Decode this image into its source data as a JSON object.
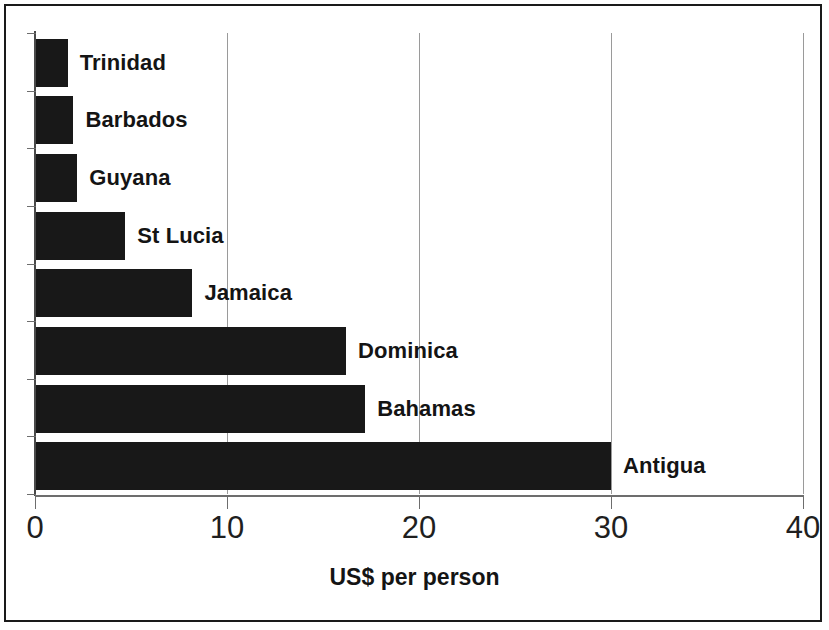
{
  "chart_data": {
    "type": "bar",
    "orientation": "horizontal",
    "title": "",
    "xlabel": "US$ per person",
    "ylabel": "",
    "categories": [
      "Trinidad",
      "Barbados",
      "Guyana",
      "St Lucia",
      "Jamaica",
      "Dominica",
      "Bahamas",
      "Antigua"
    ],
    "values": [
      1.7,
      2.0,
      2.2,
      4.7,
      8.2,
      16.2,
      17.2,
      30.0
    ],
    "xlim": [
      0,
      40
    ],
    "xticks": [
      0,
      10,
      20,
      30,
      40
    ],
    "xtick_labels": [
      "0",
      "10",
      "20",
      "30",
      "40"
    ],
    "grid": "vertical",
    "legend": "none",
    "bar_color": "#181818",
    "gridline_color": "#9a9a9a",
    "axis_color": "#6d6d6d",
    "label_color": "#141414",
    "labels_inside_plot": true
  }
}
